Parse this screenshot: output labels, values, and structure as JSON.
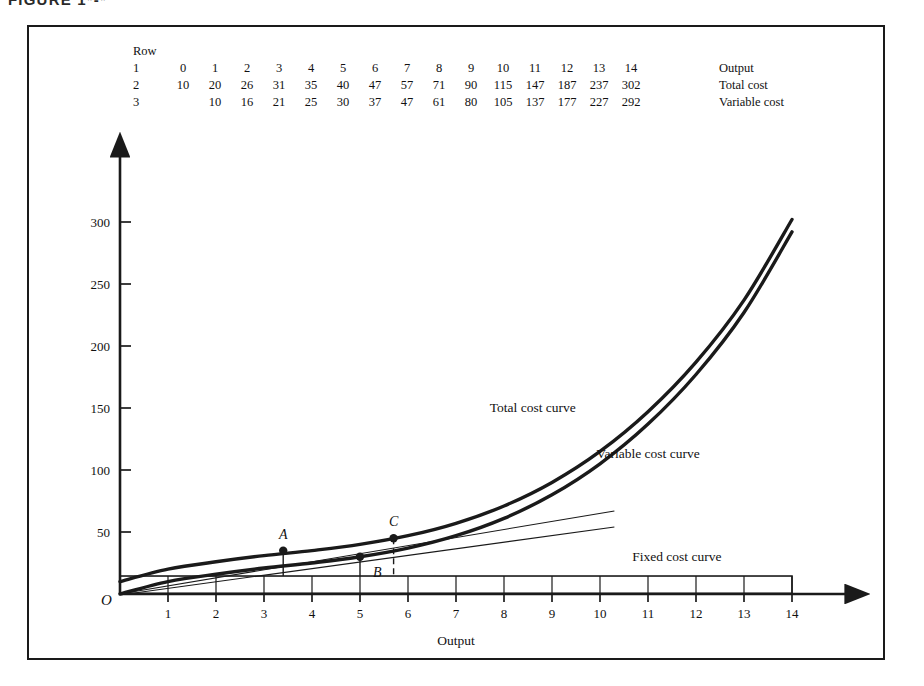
{
  "figure": {
    "caption": "FIGURE 1*-*"
  },
  "table": {
    "row_header": "Row",
    "rows": [
      {
        "number": "1",
        "name": "Output",
        "values": [
          "0",
          "1",
          "2",
          "3",
          "4",
          "5",
          "6",
          "7",
          "8",
          "9",
          "10",
          "11",
          "12",
          "13",
          "14"
        ]
      },
      {
        "number": "2",
        "name": "Total cost",
        "values": [
          "10",
          "20",
          "26",
          "31",
          "35",
          "40",
          "47",
          "57",
          "71",
          "90",
          "115",
          "147",
          "187",
          "237",
          "302"
        ]
      },
      {
        "number": "3",
        "name": "Variable cost",
        "values": [
          "",
          "10",
          "16",
          "21",
          "25",
          "30",
          "37",
          "47",
          "61",
          "80",
          "105",
          "137",
          "177",
          "227",
          "292"
        ]
      }
    ]
  },
  "axes": {
    "origin_label": "O",
    "x_title": "Output",
    "x_ticks": [
      "1",
      "2",
      "3",
      "4",
      "5",
      "6",
      "7",
      "8",
      "9",
      "10",
      "11",
      "12",
      "13",
      "14"
    ],
    "y_ticks": [
      "50",
      "100",
      "150",
      "200",
      "250",
      "300"
    ]
  },
  "curves": {
    "total_label": "Total cost curve",
    "variable_label": "Variable cost curve",
    "fixed_label": "Fixed cost curve"
  },
  "points": [
    {
      "label": "A",
      "x": 3.4,
      "y": 35
    },
    {
      "label": "B",
      "x": 5.0,
      "y": 30
    },
    {
      "label": "C",
      "x": 5.7,
      "y": 45
    }
  ],
  "colors": {
    "ink": "#1a1a1a",
    "background": "#ffffff"
  },
  "chart_data": {
    "type": "line",
    "title": "",
    "xlabel": "Output",
    "ylabel": "",
    "xlim": [
      0,
      14
    ],
    "ylim": [
      0,
      320
    ],
    "grid": false,
    "legend": "inline-annotations",
    "x": [
      0,
      1,
      2,
      3,
      4,
      5,
      6,
      7,
      8,
      9,
      10,
      11,
      12,
      13,
      14
    ],
    "series": [
      {
        "name": "Total cost curve",
        "values": [
          10,
          20,
          26,
          31,
          35,
          40,
          47,
          57,
          71,
          90,
          115,
          147,
          187,
          237,
          302
        ]
      },
      {
        "name": "Variable cost curve",
        "values": [
          0,
          10,
          16,
          21,
          25,
          30,
          37,
          47,
          61,
          80,
          105,
          137,
          177,
          227,
          292
        ]
      },
      {
        "name": "Fixed cost curve",
        "values": [
          10,
          10,
          10,
          10,
          10,
          10,
          10,
          10,
          10,
          10,
          10,
          10,
          10,
          10,
          10
        ]
      }
    ],
    "annotations": [
      {
        "label": "A",
        "x": 3.4,
        "y": 35,
        "note": "point on total cost curve"
      },
      {
        "label": "B",
        "x": 5.0,
        "y": 30,
        "note": "point on variable cost curve"
      },
      {
        "label": "C",
        "x": 5.7,
        "y": 45,
        "note": "point on total cost curve"
      }
    ],
    "x_ticks": [
      1,
      2,
      3,
      4,
      5,
      6,
      7,
      8,
      9,
      10,
      11,
      12,
      13,
      14
    ],
    "y_ticks": [
      50,
      100,
      150,
      200,
      250,
      300
    ]
  }
}
